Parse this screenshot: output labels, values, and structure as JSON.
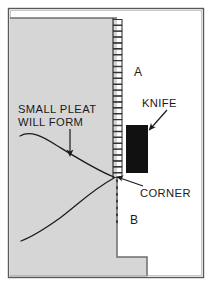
{
  "figure": {
    "background_color": "#ffffff",
    "border_color": "#4a4a4a",
    "fabric_fill": "#d6d6d6",
    "fabric_stroke": "#6e6e6e",
    "knife_fill": "#111111",
    "line_color": "#1a1a1a"
  },
  "labels": {
    "pleat_line1": "SMALL PLEAT",
    "pleat_line2": "WILL FORM",
    "knife": "KNIFE",
    "corner": "CORNER",
    "region_a": "A",
    "region_b": "B"
  },
  "annotations": {
    "pleat_arrow": "arrow-down",
    "knife_arrow": "arrow-down-left",
    "corner_leader": "leader-line-up-left"
  },
  "shapes": {
    "serrated_edge": "zigzag-overlock-stitch-edge",
    "dotted_fold_line": "vertical-dotted-line",
    "knife_blade": "black-rectangle",
    "fabric_panel": "gray-stepped-panel"
  }
}
